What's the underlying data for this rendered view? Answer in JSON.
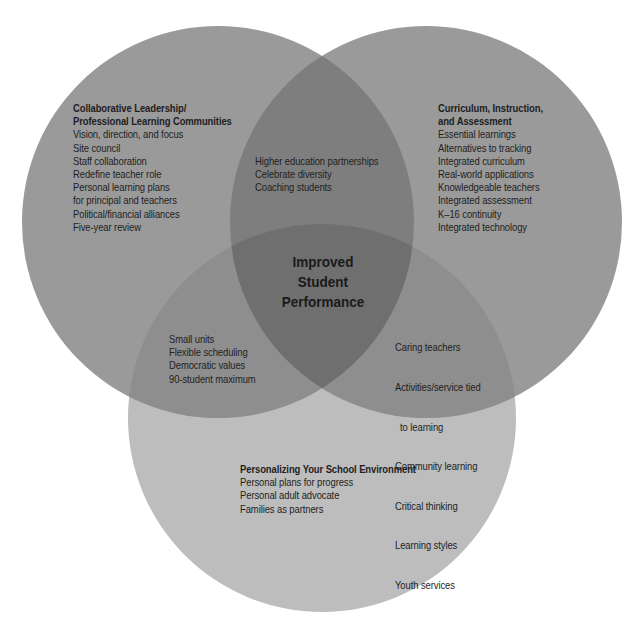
{
  "diagram": {
    "type": "venn",
    "colors": {
      "background": "#ffffff",
      "circle_top": "#9a9a9a",
      "circle_bottom": "#bdbdbd",
      "overlap_top_pair": "#7c7c7c",
      "overlap_with_bottom": "#8c8c8c",
      "center": "#6e6e6e",
      "text": "#1e1e1e"
    },
    "center": {
      "lines": [
        "Improved",
        "Student",
        "Performance"
      ]
    },
    "left_circle": {
      "title_lines": [
        "Collaborative Leadership/",
        "Professional Learning Communities"
      ],
      "items": [
        "Vision, direction, and focus",
        "Site council",
        "Staff collaboration",
        "Redefine teacher role",
        "Personal learning plans",
        "for principal and teachers",
        "Political/financial alliances",
        "Five-year review"
      ]
    },
    "right_circle": {
      "title_lines": [
        "Curriculum, Instruction,",
        "and Assessment"
      ],
      "items": [
        "Essential learnings",
        "Alternatives to tracking",
        "Integrated curriculum",
        "Real-world applications",
        "Knowledgeable teachers",
        "Integrated assessment",
        "K–16 continuity",
        "Integrated technology"
      ]
    },
    "bottom_circle": {
      "title_lines": [
        "Personalizing Your School Environment"
      ],
      "items": [
        "Personal plans for progress",
        "Personal adult advocate",
        "Families as partners"
      ]
    },
    "overlap_left_right": {
      "items": [
        "Higher education partnerships",
        "Celebrate diversity",
        "Coaching students"
      ]
    },
    "overlap_left_bottom": {
      "items": [
        "Small units",
        "Flexible scheduling",
        "Democratic values",
        "90-student maximum"
      ]
    },
    "overlap_right_bottom": {
      "items": [
        "Caring teachers",
        "Activities/service tied",
        "  to learning",
        "Community learning",
        "Critical thinking",
        "Learning styles",
        "Youth services"
      ]
    }
  }
}
